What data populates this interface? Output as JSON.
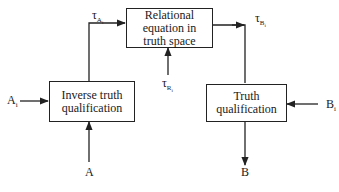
{
  "diagram": {
    "type": "block-flow",
    "colors": {
      "line": "#222222",
      "background": "#ffffff",
      "text": "#1a1a1a"
    },
    "boxes": [
      {
        "id": "inverse_truth_qualification",
        "lines": [
          "Inverse truth",
          "qualification"
        ]
      },
      {
        "id": "relational_equation",
        "lines": [
          "Relational",
          "equation in",
          "truth space"
        ]
      },
      {
        "id": "truth_qualification",
        "lines": [
          "Truth",
          "qualification"
        ]
      }
    ],
    "labels": {
      "tau_a": {
        "symbol": "τ",
        "sub": "A",
        "subsub": "i"
      },
      "tau_r": {
        "symbol": "τ",
        "sub": "R",
        "subsub": "i"
      },
      "tau_b": {
        "symbol": "τ",
        "sub": "B",
        "subsub": "i"
      },
      "a_i": {
        "symbol": "A",
        "sub": "i"
      },
      "b_i": {
        "symbol": "B",
        "sub": "i"
      },
      "a": "A",
      "b": "B"
    },
    "edges": [
      {
        "from": "A_i",
        "to": "inverse_truth_qualification"
      },
      {
        "from": "A",
        "to": "inverse_truth_qualification"
      },
      {
        "from": "inverse_truth_qualification",
        "to": "relational_equation",
        "label": "τ_Ai"
      },
      {
        "from": "τ_Ri",
        "to": "relational_equation"
      },
      {
        "from": "relational_equation",
        "to": "truth_qualification",
        "label": "τ_Bi"
      },
      {
        "from": "B_i",
        "to": "truth_qualification"
      },
      {
        "from": "truth_qualification",
        "to": "B"
      }
    ]
  }
}
